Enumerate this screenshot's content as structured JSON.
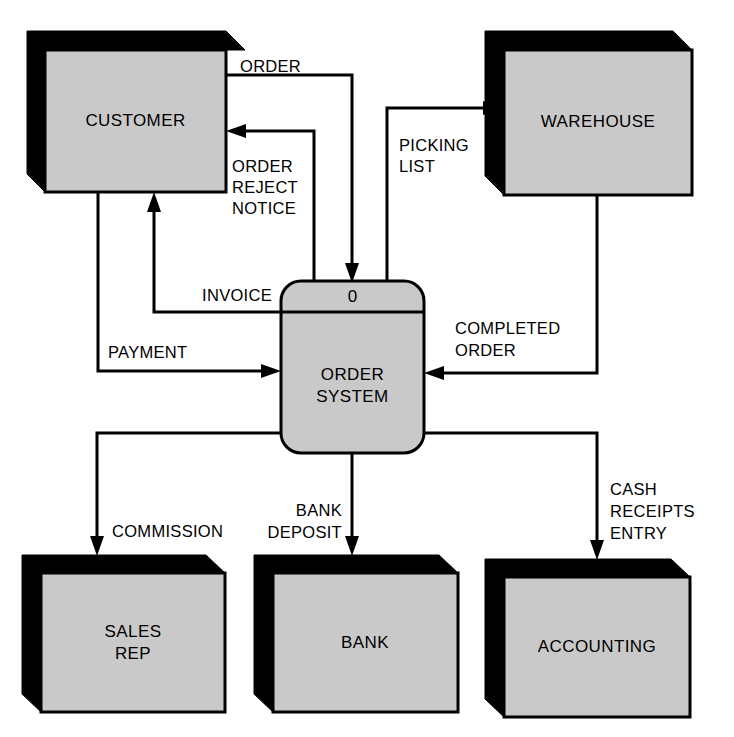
{
  "diagram": {
    "type": "data-flow-diagram",
    "level": "context",
    "title": "",
    "colors": {
      "entity_fill": "#c9c9c9",
      "process_fill": "#c9c9c9",
      "shadow": "#000000",
      "stroke": "#000000",
      "background": "#ffffff"
    },
    "process": {
      "id": "0",
      "number": "0",
      "name_line1": "ORDER",
      "name_line2": "SYSTEM"
    },
    "entities": [
      {
        "key": "customer",
        "label_line1": "CUSTOMER",
        "label_line2": ""
      },
      {
        "key": "warehouse",
        "label_line1": "WAREHOUSE",
        "label_line2": ""
      },
      {
        "key": "sales_rep",
        "label_line1": "SALES",
        "label_line2": "REP"
      },
      {
        "key": "bank",
        "label_line1": "BANK",
        "label_line2": ""
      },
      {
        "key": "accounting",
        "label_line1": "ACCOUNTING",
        "label_line2": ""
      }
    ],
    "flows": [
      {
        "key": "order",
        "from": "customer",
        "to": "process",
        "line1": "ORDER",
        "line2": "",
        "line3": ""
      },
      {
        "key": "order_reject_notice",
        "from": "process",
        "to": "customer",
        "line1": "ORDER",
        "line2": "REJECT",
        "line3": "NOTICE"
      },
      {
        "key": "invoice",
        "from": "process",
        "to": "customer",
        "line1": "INVOICE",
        "line2": "",
        "line3": ""
      },
      {
        "key": "payment",
        "from": "customer",
        "to": "process",
        "line1": "PAYMENT",
        "line2": "",
        "line3": ""
      },
      {
        "key": "picking_list",
        "from": "process",
        "to": "warehouse",
        "line1": "PICKING",
        "line2": "LIST",
        "line3": ""
      },
      {
        "key": "completed_order",
        "from": "warehouse",
        "to": "process",
        "line1": "COMPLETED",
        "line2": "ORDER",
        "line3": ""
      },
      {
        "key": "commission",
        "from": "process",
        "to": "sales_rep",
        "line1": "COMMISSION",
        "line2": "",
        "line3": ""
      },
      {
        "key": "bank_deposit",
        "from": "process",
        "to": "bank",
        "line1": "BANK",
        "line2": "DEPOSIT",
        "line3": ""
      },
      {
        "key": "cash_receipts_entry",
        "from": "process",
        "to": "accounting",
        "line1": "CASH",
        "line2": "RECEIPTS",
        "line3": "ENTRY"
      }
    ]
  }
}
